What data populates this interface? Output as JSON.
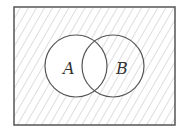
{
  "diagram": {
    "type": "venn",
    "universe": {
      "x": 14,
      "y": 7,
      "width": 161,
      "height": 118,
      "hatched": true
    },
    "sets": [
      {
        "name": "A",
        "label": "A",
        "cx": 76,
        "cy": 66,
        "r": 31,
        "hatched": false
      },
      {
        "name": "B",
        "label": "B",
        "cx": 113,
        "cy": 66,
        "r": 31,
        "hatched": true
      }
    ],
    "shaded_region": "complement of A",
    "colors": {
      "stroke": "#555555",
      "hatch": "#bdbdbd",
      "background": "#ffffff"
    }
  }
}
